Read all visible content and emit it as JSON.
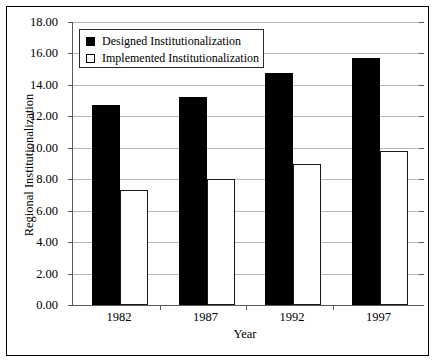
{
  "chart_data": {
    "type": "bar",
    "title": "",
    "xlabel": "Year",
    "ylabel": "Regional Institutionalization",
    "categories": [
      "1982",
      "1987",
      "1992",
      "1997"
    ],
    "series": [
      {
        "name": "Designed Institutionalization",
        "color": "#000000",
        "values": [
          12.7,
          13.2,
          14.75,
          15.7
        ]
      },
      {
        "name": "Implemented Institutionalization",
        "color": "#ffffff",
        "values": [
          7.3,
          8.0,
          8.95,
          9.8
        ]
      }
    ],
    "ylim": [
      0,
      18
    ],
    "ytick_step": 2,
    "ytick_labels": [
      "18.00",
      "16.00",
      "14.00",
      "12.00",
      "10.00",
      "8.00",
      "6.00",
      "4.00",
      "2.00",
      "0.00"
    ],
    "ytick_values": [
      18,
      16,
      14,
      12,
      10,
      8,
      6,
      4,
      2,
      0
    ],
    "grid": true,
    "legend_position": "upper-left",
    "frame": true
  }
}
